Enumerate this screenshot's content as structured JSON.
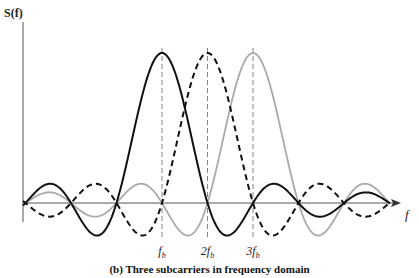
{
  "chart_data": {
    "type": "line",
    "title": "(b) Three subcarriers in frequency domain",
    "ylabel": "S(f)",
    "xlabel": "f",
    "x_tick_labels": [
      "f_b",
      "2f_b",
      "3f_b"
    ],
    "x_ticks": [
      1,
      2,
      3
    ],
    "function": "sinc((f - k*f_b)/f_b), k = 1,2,3",
    "xlim": [
      -2,
      6.2
    ],
    "ylim": [
      -0.35,
      1.1
    ],
    "grid": false,
    "legend": "none",
    "series": [
      {
        "name": "subcarrier 1 (f_b)",
        "center": 1,
        "style": "solid",
        "color": "#111111",
        "peak": 1.0,
        "zeros": [
          -2,
          -1,
          0,
          2,
          3,
          4,
          5
        ]
      },
      {
        "name": "subcarrier 2 (2f_b)",
        "center": 2,
        "style": "dashed",
        "color": "#111111",
        "peak": 1.0,
        "zeros": [
          -1,
          0,
          1,
          3,
          4,
          5
        ]
      },
      {
        "name": "subcarrier 3 (3f_b)",
        "center": 3,
        "style": "solid",
        "color": "#aaaaaa",
        "peak": 1.0,
        "zeros": [
          0,
          1,
          2,
          4,
          5
        ]
      }
    ]
  },
  "labels": {
    "ylabel": "S(f)",
    "xlabel": "f",
    "ticks": [
      "fb",
      "2fb",
      "3fb"
    ],
    "caption": "(b) Three subcarriers in frequency domain"
  }
}
